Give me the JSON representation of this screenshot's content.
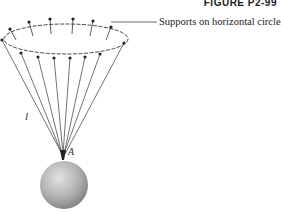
{
  "figure": {
    "title": "FIGURE P2-99",
    "support_label": "Supports on horizontal circle",
    "length_label": "l",
    "point_label": "A"
  },
  "colors": {
    "line": "#333333",
    "sphere_light": "#d8d8d8",
    "sphere_dark": "#8a8a8a"
  },
  "geometry": {
    "circle_center": [
      66,
      39
    ],
    "circle_rx": 62,
    "circle_ry": 15,
    "support_count": 12,
    "attachment_point": [
      63,
      155
    ],
    "sphere_center": [
      64,
      185
    ],
    "sphere_radius": 24
  }
}
